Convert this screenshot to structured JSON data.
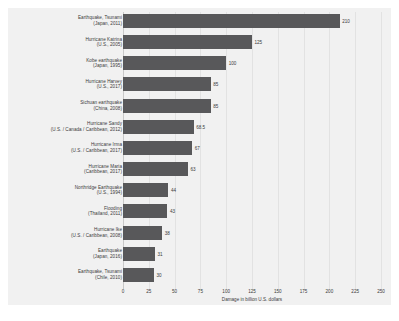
{
  "chart_data": {
    "type": "bar",
    "orientation": "horizontal",
    "title": "",
    "xlabel": "Damage in billion U.S. dollars",
    "ylabel": "",
    "xlim": [
      0,
      250
    ],
    "xticks": [
      0,
      25,
      50,
      75,
      100,
      125,
      150,
      175,
      200,
      225,
      250
    ],
    "grid": true,
    "legend": false,
    "bar_color": "#58585a",
    "panel_color": "#f1f1f1",
    "categories": [
      "Earthquake, Tsunami (Japan, 2011)",
      "Hurricane Katrina (U.S., 2005)",
      "Kobe earthquake (Japan, 1995)",
      "Hurricane Harvey (U.S., 2017)",
      "Sichuan earthquake (China, 2008)",
      "Hurricane Sandy (U.S. / Canada / Caribbean, 2012)",
      "Hurricane Irma (U.S. / Caribbean, 2017)",
      "Hurricane Maria (Caribbean, 2017)",
      "Northridge Earthquake (U.S., 1994)",
      "Flooding (Thailand, 2011)",
      "Hurricane Ike (U.S. / Caribbean, 2008)",
      "Earthquake (Japan, 2016)",
      "Earthquake, Tsunami (Chile, 2010)"
    ],
    "values": [
      210,
      125,
      100,
      85,
      85,
      68.5,
      67,
      63,
      44,
      43,
      38,
      31,
      30
    ]
  },
  "rows": [
    {
      "line1": "Earthquake, Tsunami",
      "line2": "(Japan, 2011)",
      "value": 210,
      "value_label": "210"
    },
    {
      "line1": "Hurricane Katrina",
      "line2": "(U.S., 2005)",
      "value": 125,
      "value_label": "125"
    },
    {
      "line1": "Kobe earthquake",
      "line2": "(Japan, 1995)",
      "value": 100,
      "value_label": "100"
    },
    {
      "line1": "Hurricane Harvey",
      "line2": "(U.S., 2017)",
      "value": 85,
      "value_label": "85"
    },
    {
      "line1": "Sichuan earthquake",
      "line2": "(China, 2008)",
      "value": 85,
      "value_label": "85"
    },
    {
      "line1": "Hurricane Sandy",
      "line2": "(U.S. / Canada / Caribbean, 2012)",
      "value": 68.5,
      "value_label": "68.5"
    },
    {
      "line1": "Hurricane Irma",
      "line2": "(U.S. / Caribbean, 2017)",
      "value": 67,
      "value_label": "67"
    },
    {
      "line1": "Hurricane Maria",
      "line2": "(Caribbean, 2017)",
      "value": 63,
      "value_label": "63"
    },
    {
      "line1": "Northridge Earthquake",
      "line2": "(U.S., 1994)",
      "value": 44,
      "value_label": "44"
    },
    {
      "line1": "Flooding",
      "line2": "(Thailand, 2011)",
      "value": 43,
      "value_label": "43"
    },
    {
      "line1": "Hurricane Ike",
      "line2": "(U.S. / Caribbean, 2008)",
      "value": 38,
      "value_label": "38"
    },
    {
      "line1": "Earthquake",
      "line2": "(Japan, 2016)",
      "value": 31,
      "value_label": "31"
    },
    {
      "line1": "Earthquake, Tsunami",
      "line2": "(Chile, 2010)",
      "value": 30,
      "value_label": "30"
    }
  ],
  "axis": {
    "ticks": [
      "0",
      "25",
      "50",
      "75",
      "100",
      "125",
      "150",
      "175",
      "200",
      "225",
      "250"
    ],
    "title": "Damage in billion U.S. dollars"
  }
}
